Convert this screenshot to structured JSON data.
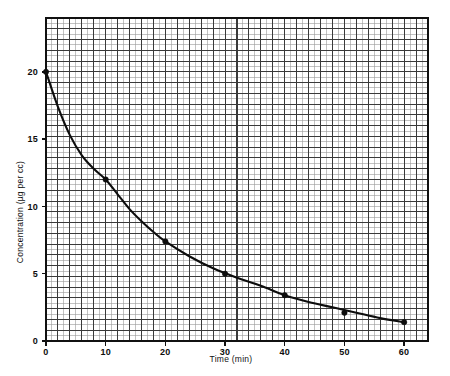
{
  "figure": {
    "background_color": "#ffffff",
    "ink_color": "#111111",
    "grid_minor_color": "#9a9a9a",
    "grid_major_color": "#3a3a3a",
    "axis_color": "#111111",
    "curve_color": "#0d0d0d",
    "marker_color": "#0d0d0d"
  },
  "chart_data": {
    "type": "line",
    "title": "",
    "subtitle": "",
    "xlabel": "Time (min)",
    "ylabel": "Concentration (µg per cc)",
    "xlim": [
      0,
      64
    ],
    "ylim": [
      0,
      24
    ],
    "xticks": [
      0,
      10,
      20,
      30,
      40,
      50,
      60
    ],
    "xtick_labels": [
      "0",
      "10",
      "20",
      "30",
      "40",
      "50",
      "60"
    ],
    "yticks": [
      0,
      5,
      10,
      15,
      20
    ],
    "ytick_labels": [
      "0",
      "5",
      "10",
      "15",
      "20"
    ],
    "grid": true,
    "grid_minor_step_x": 1,
    "grid_major_step_x": 2,
    "grid_minor_step_y": 0.4,
    "grid_major_step_y": 0.8,
    "legend": false,
    "legend_position": "none",
    "series": [
      {
        "name": "Concentration decay",
        "marker": "filled-circle",
        "line_style": "solid",
        "x": [
          0,
          10,
          20,
          30,
          40,
          50,
          60
        ],
        "y": [
          20.0,
          12.0,
          7.4,
          5.0,
          3.4,
          2.1,
          1.4
        ],
        "curve_x": [
          0,
          2,
          4,
          6,
          8,
          10,
          12,
          14,
          16,
          18,
          20,
          24,
          28,
          32,
          36,
          40,
          44,
          48,
          52,
          56,
          60
        ],
        "curve_y": [
          20.0,
          17.4,
          15.3,
          13.8,
          12.8,
          12.0,
          10.9,
          9.8,
          8.9,
          8.1,
          7.4,
          6.3,
          5.4,
          4.7,
          4.1,
          3.4,
          2.9,
          2.5,
          2.1,
          1.7,
          1.4
        ]
      }
    ],
    "annotations": []
  }
}
